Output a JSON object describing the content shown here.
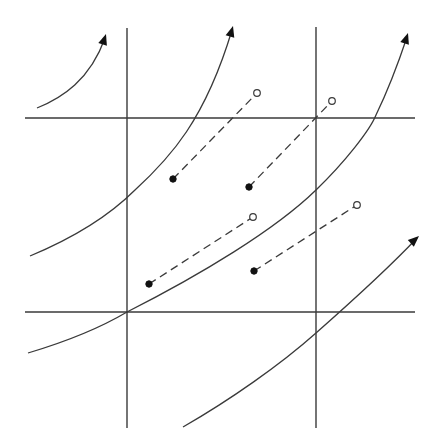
{
  "diagram": {
    "width": 437,
    "height": 445,
    "colors": {
      "background": "#ffffff",
      "line": "#3a3a3a",
      "point_filled": "#111111",
      "point_open_fill": "#ffffff"
    },
    "grid_lines": {
      "vertical": [
        {
          "x": 127,
          "y1": 28,
          "y2": 428
        },
        {
          "x": 316,
          "y1": 27,
          "y2": 428
        }
      ],
      "horizontal": [
        {
          "y": 118,
          "x1": 25,
          "x2": 415
        },
        {
          "y": 312,
          "x1": 25,
          "x2": 415
        }
      ]
    },
    "curves": [
      {
        "id": "curve-1",
        "path": "M37,108 C62,98 90,80 105,38",
        "arrow_at_end": true,
        "arrow_tip": [
          106,
          34
        ],
        "arrow_angle": -72
      },
      {
        "id": "curve-2",
        "path": "M30,256 C78,236 110,215 135,190 C170,158 205,120 232,30",
        "arrow_at_end": true,
        "arrow_tip": [
          233,
          26
        ],
        "arrow_angle": -74
      },
      {
        "id": "curve-3",
        "path": "M28,353 C65,342 100,328 127,312 C200,275 275,230 316,190 C345,162 370,130 376,115 C392,82 400,58 407,37",
        "arrow_at_end": true,
        "arrow_tip": [
          408,
          33
        ],
        "arrow_angle": -72
      },
      {
        "id": "curve-4",
        "path": "M183,427 C230,400 280,365 316,333 C350,303 385,272 417,238",
        "arrow_at_end": true,
        "arrow_tip": [
          419,
          236
        ],
        "arrow_angle": -42
      }
    ],
    "displacements": [
      {
        "id": "shift-1",
        "from": [
          173,
          179
        ],
        "to": [
          257,
          93
        ]
      },
      {
        "id": "shift-2",
        "from": [
          249,
          187
        ],
        "to": [
          332,
          101
        ]
      },
      {
        "id": "shift-3",
        "from": [
          149,
          284
        ],
        "to": [
          253,
          217
        ]
      },
      {
        "id": "shift-4",
        "from": [
          254,
          271
        ],
        "to": [
          357,
          205
        ]
      }
    ],
    "point_radius": {
      "filled": 3.2,
      "open": 3.3
    }
  }
}
